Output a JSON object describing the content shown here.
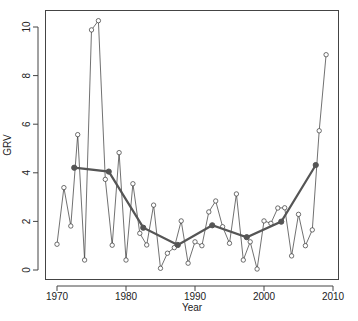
{
  "chart_data": {
    "type": "line",
    "title": "",
    "xlabel": "Year",
    "ylabel": "GRV",
    "xlim": [
      1968.5,
      2011
    ],
    "ylim": [
      -0.4,
      10.7
    ],
    "x_ticks": [
      1970,
      1980,
      1990,
      2000,
      2010
    ],
    "y_ticks": [
      0,
      2,
      4,
      6,
      8,
      10
    ],
    "grid": false,
    "legend": null,
    "series": [
      {
        "name": "annual GRV",
        "style": "line-with-hollow-circles",
        "color": "#333333",
        "x": [
          1970,
          1971,
          1972,
          1973,
          1974,
          1975,
          1976,
          1977,
          1978,
          1979,
          1980,
          1981,
          1982,
          1983,
          1984,
          1985,
          1986,
          1987,
          1988,
          1989,
          1990,
          1991,
          1992,
          1993,
          1994,
          1995,
          1996,
          1997,
          1998,
          1999,
          2000,
          2001,
          2002,
          2003,
          2004,
          2005,
          2006,
          2007,
          2008,
          2009
        ],
        "values": [
          1.06,
          3.39,
          1.81,
          5.57,
          0.41,
          9.88,
          10.26,
          3.73,
          1.02,
          4.83,
          0.41,
          3.55,
          1.51,
          1.03,
          2.67,
          0.07,
          0.69,
          0.92,
          2.02,
          0.28,
          1.16,
          1.0,
          2.39,
          2.84,
          1.78,
          1.1,
          3.13,
          0.41,
          1.16,
          0.04,
          2.02,
          1.92,
          2.55,
          2.56,
          0.58,
          2.29,
          1.0,
          1.65,
          5.73,
          8.86
        ]
      },
      {
        "name": "5-year mean",
        "style": "thick-line-with-filled-points",
        "color": "#555555",
        "x": [
          1972.5,
          1977.5,
          1982.5,
          1987.5,
          1992.5,
          1997.5,
          2002.5,
          2007.5
        ],
        "values": [
          4.21,
          4.05,
          1.74,
          1.03,
          1.84,
          1.35,
          1.99,
          4.32
        ]
      }
    ]
  }
}
